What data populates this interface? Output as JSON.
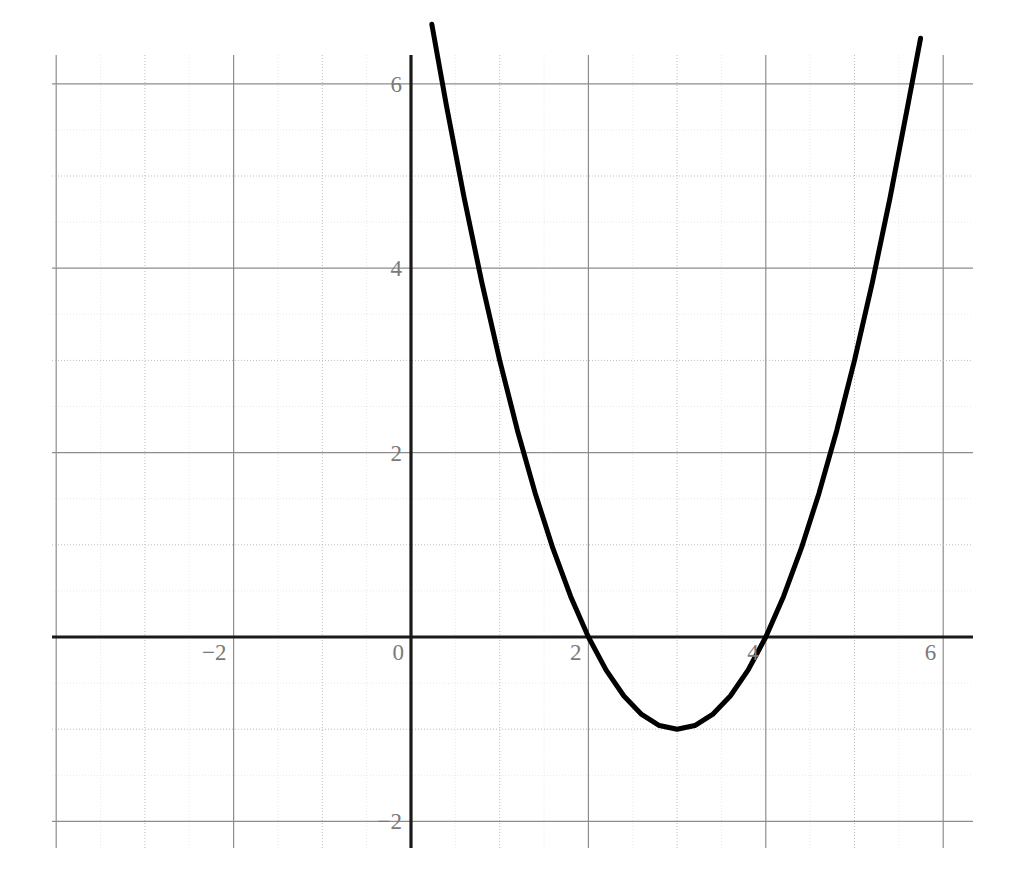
{
  "chart_data": {
    "type": "line",
    "title": "",
    "subtitle": "",
    "xlabel": "",
    "ylabel": "",
    "grid": true,
    "legend": null,
    "legend_position": "none",
    "xlim": [
      -4.05,
      6.34
    ],
    "ylim": [
      -2.29,
      6.32
    ],
    "x_major_step": 1,
    "x_minor_step": 0.5,
    "y_major_step": 1,
    "y_minor_step": 0.5,
    "x_tick_labels": [
      "-2",
      "0",
      "2",
      "4",
      "6"
    ],
    "x_tick_values": [
      -2,
      0,
      2,
      4,
      6
    ],
    "y_tick_labels": [
      "-2",
      "2",
      "4",
      "6"
    ],
    "y_tick_values": [
      -2,
      2,
      4,
      6
    ],
    "series": [
      {
        "name": "y = x^2 - 6x + 8",
        "equation": "y = x^2 - 6x + 8",
        "factored": "y = (x - 2)(x - 4)",
        "color": "#000000",
        "line_width": 5,
        "roots": [
          2,
          4
        ],
        "vertex": [
          3,
          -1
        ],
        "y_intercept": 8,
        "x_domain": [
          0.235,
          5.745
        ],
        "points": [
          [
            0.235,
            6.645
          ],
          [
            0.4,
            5.76
          ],
          [
            0.6,
            4.76
          ],
          [
            0.8,
            3.84
          ],
          [
            1.0,
            3.0
          ],
          [
            1.2,
            2.24
          ],
          [
            1.4,
            1.56
          ],
          [
            1.6,
            0.96
          ],
          [
            1.8,
            0.44
          ],
          [
            2.0,
            0.0
          ],
          [
            2.2,
            -0.36
          ],
          [
            2.4,
            -0.64
          ],
          [
            2.6,
            -0.84
          ],
          [
            2.8,
            -0.96
          ],
          [
            3.0,
            -1.0
          ],
          [
            3.2,
            -0.96
          ],
          [
            3.4,
            -0.84
          ],
          [
            3.6,
            -0.64
          ],
          [
            3.8,
            -0.36
          ],
          [
            4.0,
            0.0
          ],
          [
            4.2,
            0.44
          ],
          [
            4.4,
            0.96
          ],
          [
            4.6,
            1.56
          ],
          [
            4.8,
            2.24
          ],
          [
            5.0,
            3.0
          ],
          [
            5.2,
            3.84
          ],
          [
            5.4,
            4.76
          ],
          [
            5.6,
            5.76
          ],
          [
            5.745,
            6.495
          ]
        ]
      }
    ],
    "colors": {
      "curve": "#000000",
      "axis": "#1a1a1a",
      "grid_major_strong": "#8d8d8d",
      "grid_major": "#bcbcbc",
      "grid_minor": "#e8e8e8",
      "tick_label": "#7a7a7a",
      "background": "#ffffff"
    },
    "geometry": {
      "plot_left": 52,
      "plot_right": 973,
      "plot_top": 55,
      "plot_bottom": 848,
      "origin_x": 411,
      "origin_y": 637,
      "px_per_unit_x": 88.7,
      "px_per_unit_y": 92.2
    }
  }
}
